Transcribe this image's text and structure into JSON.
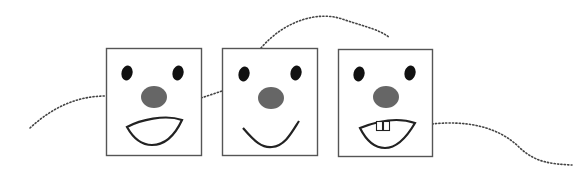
{
  "illustration": {
    "description": "Three square faces connected by dotted lines",
    "colors": {
      "frame": "#555555",
      "eye": "#111111",
      "nose": "#666666",
      "mouth": "#222222",
      "dots": "#444444"
    },
    "faces": [
      {
        "label": "face-open-mouth",
        "mouth": "open"
      },
      {
        "label": "face-smile",
        "mouth": "smile"
      },
      {
        "label": "face-teeth",
        "mouth": "open-with-teeth"
      }
    ]
  }
}
